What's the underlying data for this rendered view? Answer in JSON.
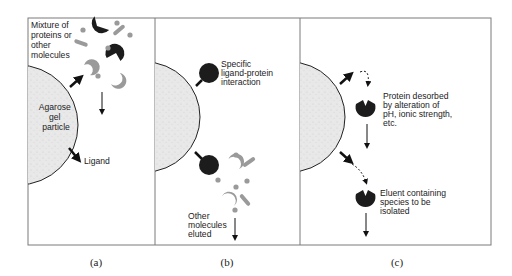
{
  "figure": {
    "panels": [
      {
        "id": "a",
        "caption": "(a)",
        "labels": {
          "mixture": [
            "Mixture of",
            "proteins or",
            "other",
            "molecules"
          ],
          "bead": [
            "Agarose",
            "gel",
            "particle"
          ],
          "ligand": "Ligand"
        }
      },
      {
        "id": "b",
        "caption": "(b)",
        "labels": {
          "interaction": [
            "Specific",
            "ligand-protein",
            "interaction"
          ],
          "eluted": [
            "Other",
            "molecules",
            "eluted"
          ]
        }
      },
      {
        "id": "c",
        "caption": "(c)",
        "labels": {
          "desorbed": [
            "Protein desorbed",
            "by alteration of",
            "pH, ionic strength,",
            "etc."
          ],
          "eluent": [
            "Eluent containing",
            "species to be",
            "isolated"
          ]
        }
      }
    ],
    "colors": {
      "target_protein": "#1c1c1c",
      "other_molecules": "#9a9a9a",
      "bead_fill": "#e6e6e6",
      "frame": "#7a7a7a"
    }
  }
}
